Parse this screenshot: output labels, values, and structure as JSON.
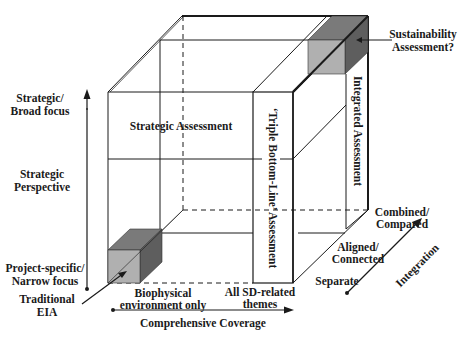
{
  "diagram": {
    "type": "3d-cube-framework",
    "colors": {
      "line": "#1a1a1a",
      "small_cube_front": "#b0b0b0",
      "small_cube_top": "#7a7a7a",
      "small_cube_side": "#5e5e5e",
      "background": "#ffffff"
    },
    "vertical_axis": {
      "title_line1": "Strategic",
      "title_line2": "Perspective",
      "top_line1": "Strategic/",
      "top_line2": "Broad focus",
      "bottom_line1": "Project-specific/",
      "bottom_line2": "Narrow focus"
    },
    "horizontal_axis": {
      "title": "Comprehensive Coverage",
      "left_line1": "Biophysical",
      "left_line2": "environment only",
      "right_line1": "All SD-related",
      "right_line2": "themes"
    },
    "depth_axis": {
      "title": "Integration",
      "levels": [
        {
          "line1": "Separate",
          "line2": ""
        },
        {
          "line1": "Aligned/",
          "line2": "Connected"
        },
        {
          "line1": "Combined/",
          "line2": "Compared"
        }
      ]
    },
    "regions": {
      "strategic": "Strategic Assessment",
      "triple_bottom_line": "‘Triple Bottom-Line’ Assessment",
      "integrated": "Integrated Assessment"
    },
    "callouts": {
      "traditional_line1": "Traditional",
      "traditional_line2": "EIA",
      "sustainability_line1": "Sustainability",
      "sustainability_line2": "Assessment?"
    }
  }
}
